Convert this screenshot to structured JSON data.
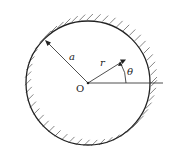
{
  "figure": {
    "type": "polar coordinate diagram of circular boundary",
    "labels": {
      "radius_a": "a",
      "radius_r": "r",
      "angle": "θ",
      "origin": "O"
    },
    "geometry": {
      "center": [
        88,
        83
      ],
      "radius": 62,
      "a_angle_deg": 135,
      "r_angle_deg": 32,
      "r_length": 42
    },
    "colors": {
      "stroke": "#222222",
      "hatch": "#555555"
    }
  }
}
